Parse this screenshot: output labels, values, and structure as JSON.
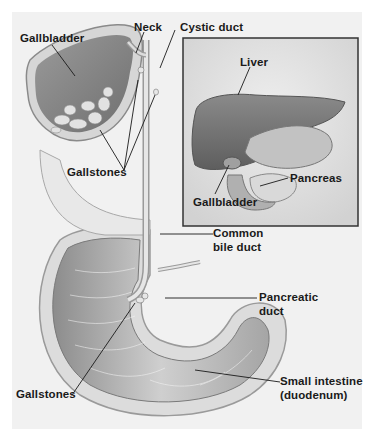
{
  "diagram": {
    "main_view": {
      "labels": {
        "gallbladder": "Gallbladder",
        "neck": "Neck",
        "cystic_duct": "Cystic duct",
        "gallstones_upper": "Gallstones",
        "common_bile_duct_line1": "Common",
        "common_bile_duct_line2": "bile duct",
        "pancreatic_duct_line1": "Pancreatic",
        "pancreatic_duct_line2": "duct",
        "gallstones_lower": "Gallstones",
        "small_intestine_line1": "Small intestine",
        "small_intestine_line2": "(duodenum)"
      }
    },
    "inset_view": {
      "labels": {
        "liver": "Liver",
        "gallbladder": "Gallbladder",
        "pancreas": "Pancreas"
      }
    },
    "colors": {
      "background": "#f1f1f1",
      "tissue_light": "#e4e4e4",
      "tissue_mid": "#b8b8b8",
      "tissue_dark": "#7a7a7a",
      "leader_line": "#1a1a1a",
      "inset_border": "#333333"
    }
  }
}
